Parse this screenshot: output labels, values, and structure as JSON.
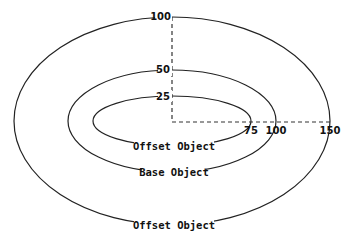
{
  "diagram": {
    "ellipses": [
      {
        "name": "inner-offset",
        "label": "Offset Object"
      },
      {
        "name": "base",
        "label": "Base Object"
      },
      {
        "name": "outer-offset",
        "label": "Offset Object"
      }
    ],
    "vertical_ticks": [
      "100",
      "50",
      "25"
    ],
    "horizontal_ticks": [
      "75",
      "100",
      "150"
    ],
    "colors": {
      "stroke": "#222222",
      "background": "#ffffff"
    }
  }
}
